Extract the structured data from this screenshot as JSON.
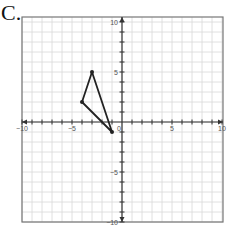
{
  "problem_label": "C.",
  "chart_data": {
    "type": "scatter",
    "title": "",
    "xlabel": "",
    "ylabel": "",
    "xlim": [
      -10,
      10
    ],
    "ylim": [
      -10,
      10
    ],
    "grid": true,
    "x_ticks_labeled": [
      "-10",
      "-5",
      "0",
      "5",
      "10"
    ],
    "y_ticks_labeled": [
      "10",
      "5",
      "-5",
      "-10"
    ],
    "shape": "triangle",
    "series": [
      {
        "name": "triangle",
        "points": [
          [
            -3,
            5
          ],
          [
            -4,
            2
          ],
          [
            -1,
            -1
          ]
        ],
        "closed": true
      }
    ]
  },
  "colors": {
    "grid": "#d8d8d8",
    "axis": "#333333",
    "frame": "#777777",
    "triangle": "#222222"
  }
}
